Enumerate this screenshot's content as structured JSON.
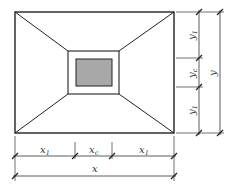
{
  "diagram": {
    "type": "foundation-plan-dimension-drawing",
    "colors": {
      "line": "#222222",
      "column_fill": "#a8a8a8",
      "background": "#ffffff"
    },
    "bottom_dimensions": {
      "segments": [
        {
          "label": "x",
          "subscript": "1"
        },
        {
          "label": "x",
          "subscript": "c"
        },
        {
          "label": "x",
          "subscript": "1"
        }
      ],
      "total": {
        "label": "x"
      }
    },
    "right_dimensions": {
      "segments": [
        {
          "label": "y",
          "subscript": "1"
        },
        {
          "label": "y",
          "subscript": "c"
        },
        {
          "label": "y",
          "subscript": "1"
        }
      ],
      "total": {
        "label": "y"
      }
    }
  }
}
